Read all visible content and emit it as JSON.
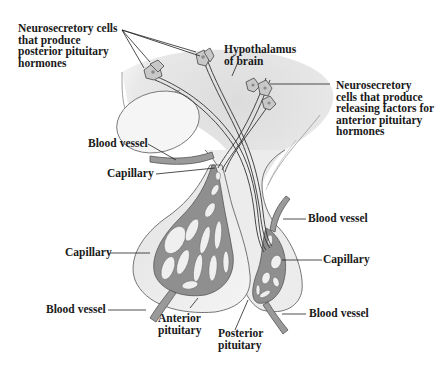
{
  "diagram": {
    "type": "anatomical-illustration",
    "colors": {
      "tissue_fill": "#e6e6e6",
      "tissue_light": "#f2f2f2",
      "outline": "#555555",
      "vessel_fill": "#8c8c8c",
      "vessel_dark": "#5a5a5a",
      "axon": "#333333",
      "label_text": "#1a1a1a"
    }
  },
  "labels": {
    "neuro_posterior": "Neurosecretory cells\nthat produce\nposterior pituitary\nhormones",
    "hypothalamus": "Hypothalamus\nof brain",
    "neuro_anterior": "Neurosecretory\ncells that produce\nreleasing factors for\nanterior pituitary\nhormones",
    "blood_vessel_upper_left": "Blood vessel",
    "capillary_upper_left": "Capillary",
    "capillary_left": "Capillary",
    "blood_vessel_lower_left": "Blood vessel",
    "anterior_pituitary": "Anterior\npituitary",
    "posterior_pituitary": "Posterior\npituitary",
    "blood_vessel_upper_right": "Blood vessel",
    "capillary_right": "Capillary",
    "blood_vessel_lower_right": "Blood vessel"
  }
}
